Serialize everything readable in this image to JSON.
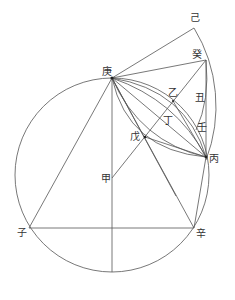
{
  "diagram": {
    "type": "geometric-construction",
    "labels": {
      "geng": "庚",
      "ji": "己",
      "gui": "癸",
      "yi": "乙",
      "ding": "丁",
      "wu": "戊",
      "chou": "丑",
      "ren": "壬",
      "bing": "丙",
      "jia": "甲",
      "zi": "子",
      "xin": "辛"
    }
  }
}
